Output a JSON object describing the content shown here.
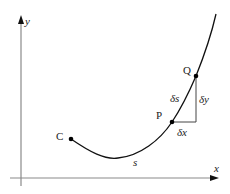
{
  "diagram": {
    "axes": {
      "x_label": "x",
      "y_label": "y",
      "axis_color": "#888888"
    },
    "points": [
      {
        "id": "C",
        "label": "C"
      },
      {
        "id": "P",
        "label": "P"
      },
      {
        "id": "Q",
        "label": "Q"
      }
    ],
    "labels": {
      "arc": "s",
      "delta_s": "δs",
      "delta_x": "δx",
      "delta_y": "δy"
    },
    "colors": {
      "curve": "#111111",
      "axis": "#888888",
      "triangle": "#444444",
      "text": "#222222"
    }
  }
}
